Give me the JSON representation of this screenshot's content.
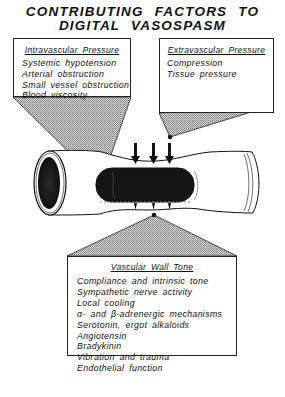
{
  "title": {
    "line1": "CONTRIBUTING FACTORS TO",
    "line2": "DIGITAL VASOSPASM"
  },
  "boxes": {
    "intravascular": {
      "header": "Intravascular Pressure",
      "items": [
        "Systemic hypotension",
        "Arterial obstruction",
        "Small vessel obstruction",
        "Blood viscosity"
      ]
    },
    "extravascular": {
      "header": "Extravascular Pressure",
      "items": [
        "Compression",
        "Tissue pressure"
      ]
    },
    "vascular_wall": {
      "header": "Vascular Wall Tone",
      "items": [
        "Compliance and intrinsic tone",
        "Sympathetic nerve activity",
        "Local cooling",
        "α- and β-adrenergic mechanisms",
        "Serotonin, ergot alkaloids",
        "Angiotensin",
        "Bradykinin",
        "Vibration and trauma",
        "Endothelial function"
      ]
    }
  },
  "illustration": {
    "subject": "blood-vessel-cross-section",
    "arrows_count": 3,
    "colors": {
      "ink": "#111111",
      "shade": "#b8b8b8",
      "paper": "#ffffff"
    }
  }
}
